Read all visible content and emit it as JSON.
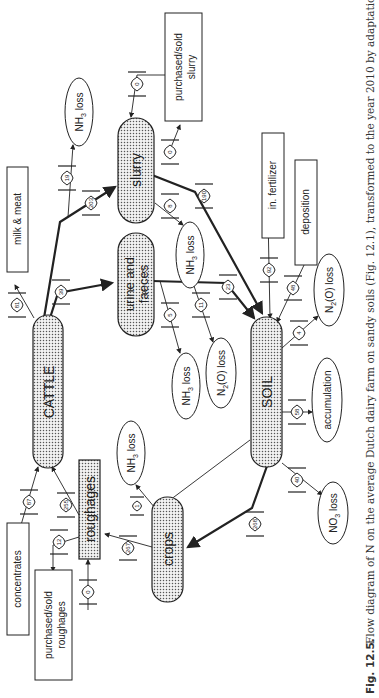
{
  "figure": {
    "label": "Fig. 12.5.",
    "caption": "Flow diagram of N on the average Dutch dairy farm on sandy soils (Fig. 12.1), transformed to the year 2010 by adaptations"
  },
  "nodes": {
    "cattle": "CATTLE",
    "slurry": "slurry",
    "urine_faeces_1": "urine and",
    "urine_faeces_2": "faeces",
    "soil": "SOIL",
    "crops": "crops",
    "roughages": "roughages",
    "milk_meat": "milk & meat",
    "purchased_slurry_1": "purchased/sold",
    "purchased_slurry_2": "slurry",
    "in_fertilizer": "in. fertilizer",
    "deposition": "deposition",
    "concentrates": "concentrates",
    "purchased_roughages_1": "purchased/sold",
    "purchased_roughages_2": "roughages",
    "nh3_loss_slurry": "NH3 loss",
    "nh3_loss_storage": "NH3 loss",
    "nh3_loss_urine": "NH3 loss",
    "nh3_loss_crops": "NH3 loss",
    "n2o_loss_urine": "N2(O) loss",
    "n2o_loss_soil": "N2(O) loss",
    "accumulation": "accumulation",
    "no3_loss": "NO3 loss"
  },
  "flows": {
    "milk_meat": "81",
    "cattle_to_urine": "39",
    "cattle_to_slurry": "203",
    "slurry_nh3": "19",
    "slurry_purchased_in": "0",
    "slurry_purchased_out": "0",
    "slurry_storage_nh3": "8",
    "slurry_to_soil": "190",
    "urine_nh3": "5",
    "urine_n2o": "11",
    "urine_to_soil": "23",
    "fertilizer_to_soil": "92",
    "deposition_to_soil": "48",
    "soil_n2o": "4",
    "soil_accumulation": "58",
    "soil_no3": "40",
    "soil_to_crops": "268",
    "crops_to_roughages": "267",
    "crops_nh3": "1",
    "roughages_to_cattle": "255",
    "roughages_sold": "12",
    "roughages_purchased": "0",
    "concentrates_to_cattle": "87"
  }
}
